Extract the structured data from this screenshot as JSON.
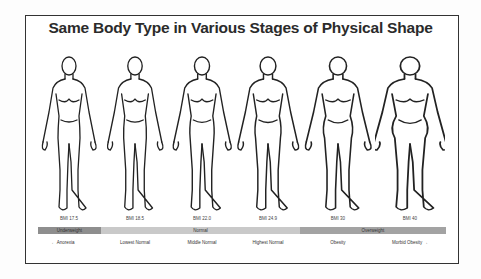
{
  "title": "Same Body Type in Various Stages of Physical Shape",
  "figures": [
    {
      "bmi": "BMI 17.5",
      "stage": "← Anorexia",
      "width_factor": 1.0
    },
    {
      "bmi": "BMI 18.5",
      "stage": "Lowest Normal",
      "width_factor": 1.03
    },
    {
      "bmi": "BMI 22.0",
      "stage": "Middle Normal",
      "width_factor": 1.08
    },
    {
      "bmi": "BMI 24.9",
      "stage": "Highest Normal",
      "width_factor": 1.13
    },
    {
      "bmi": "BMI 30",
      "stage": "Obesity",
      "width_factor": 1.22
    },
    {
      "bmi": "BMI 40",
      "stage": "Morbid Obesity →",
      "width_factor": 1.38
    }
  ],
  "bands": [
    {
      "label": "Underweight",
      "color": "#8e8e8e"
    },
    {
      "label": "Normal",
      "color": "#c9c9c9"
    },
    {
      "label": "Overweight",
      "color": "#a3a3a3"
    }
  ]
}
